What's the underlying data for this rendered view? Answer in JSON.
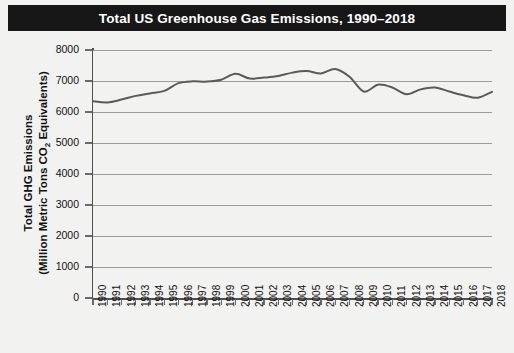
{
  "title": "Total US Greenhouse Gas Emissions, 1990–2018",
  "axis": {
    "y_title_line1": "Total GHG Emissions",
    "y_title_line2_pre": "(Million Metric Tons CO",
    "y_title_line2_sub": "2",
    "y_title_line2_post": " Equivalents)"
  },
  "chart_data": {
    "type": "line",
    "title": "Total US Greenhouse Gas Emissions, 1990–2018",
    "xlabel": "",
    "ylabel": "Total GHG Emissions (Million Metric Tons CO2 Equivalents)",
    "xlim": [
      1990,
      2018
    ],
    "ylim": [
      0,
      8000
    ],
    "yticks": [
      0,
      1000,
      2000,
      3000,
      4000,
      5000,
      6000,
      7000,
      8000
    ],
    "ytick_labels": [
      "0",
      "1000",
      "2000",
      "3000",
      "4000",
      "5000",
      "6000",
      "7000",
      "8000"
    ],
    "grid": true,
    "legend": false,
    "line_color": "#5a5a5a",
    "categories": [
      1990,
      1991,
      1992,
      1993,
      1994,
      1995,
      1996,
      1997,
      1998,
      1999,
      2000,
      2001,
      2002,
      2003,
      2004,
      2005,
      2006,
      2007,
      2008,
      2009,
      2010,
      2011,
      2012,
      2013,
      2014,
      2015,
      2016,
      2017,
      2018
    ],
    "xtick_labels": [
      "1990",
      "1991",
      "1992",
      "1993",
      "1994",
      "1995",
      "1996",
      "1997",
      "1998",
      "1999",
      "2000",
      "2001",
      "2002",
      "2003",
      "2004",
      "2005",
      "2006",
      "2007",
      "2008",
      "2009",
      "2010",
      "2011",
      "2012",
      "2013",
      "2014",
      "2015",
      "2016",
      "2017",
      "2018"
    ],
    "series": [
      {
        "name": "Total US GHG Emissions",
        "values": [
          6350,
          6310,
          6400,
          6520,
          6600,
          6680,
          6930,
          6990,
          6980,
          7040,
          7230,
          7080,
          7110,
          7160,
          7270,
          7320,
          7240,
          7390,
          7140,
          6660,
          6880,
          6790,
          6570,
          6730,
          6790,
          6660,
          6540,
          6460,
          6650
        ]
      }
    ]
  }
}
